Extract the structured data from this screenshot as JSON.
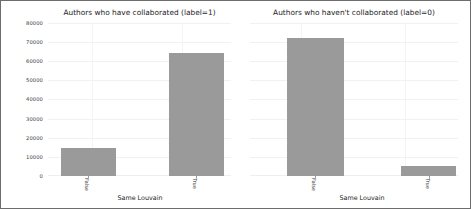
{
  "chart_data": {
    "type": "bar",
    "title": "",
    "xlabel": "Same Louvain",
    "ylabel": "",
    "ylim": [
      0,
      80000
    ],
    "grid": true,
    "legend": "none",
    "yticks": [
      "80000",
      "70000",
      "60000",
      "50000",
      "40000",
      "30000",
      "20000",
      "10000",
      "0"
    ],
    "ytick_values": [
      80000,
      70000,
      60000,
      50000,
      40000,
      30000,
      20000,
      10000,
      0
    ],
    "panels": [
      {
        "title": "Authors who have collaborated (label=1)",
        "xlabel": "Same Louvain",
        "categories": [
          "False",
          "True"
        ],
        "values": [
          14800,
          64300
        ]
      },
      {
        "title": "Authors who haven't collaborated (label=0)",
        "xlabel": "Same Louvain",
        "categories": [
          "False",
          "True"
        ],
        "values": [
          72300,
          5300
        ]
      }
    ],
    "colors": {
      "bar": "#9a9a9a",
      "background": "#ffffff",
      "grid": "#f1f1f1",
      "border": "#6d6d6d",
      "text": "#1d1d1d"
    }
  }
}
